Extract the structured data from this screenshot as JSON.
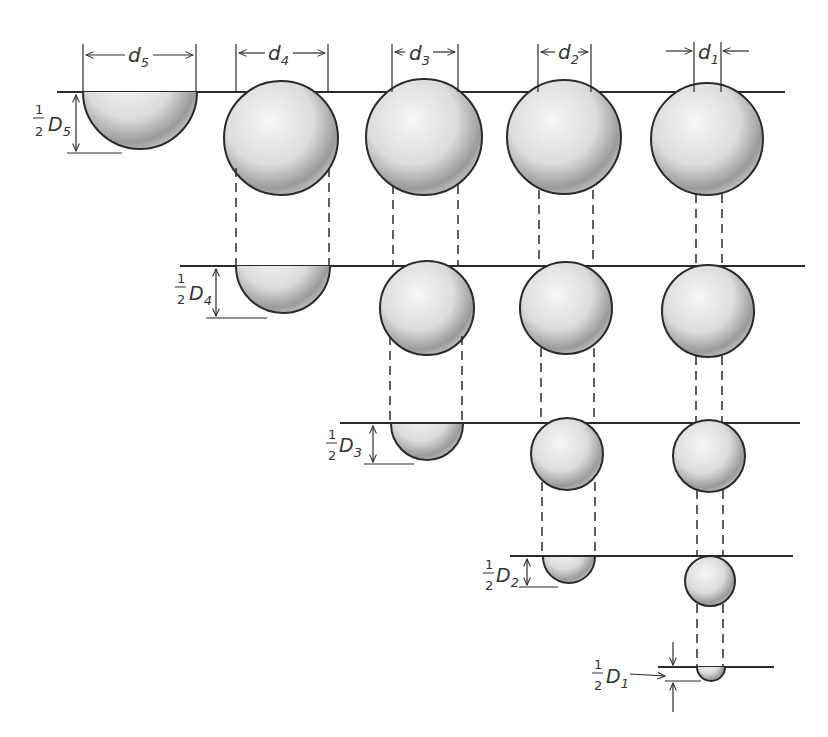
{
  "figure": {
    "colors": {
      "line": "#2a2a2a",
      "shade_light": "#f2f2f2",
      "shade_dark": "#8a8a8a"
    }
  },
  "top_labels": [
    {
      "id": "d5",
      "base": "d",
      "sub": "5"
    },
    {
      "id": "d4",
      "base": "d",
      "sub": "4"
    },
    {
      "id": "d3",
      "base": "d",
      "sub": "3"
    },
    {
      "id": "d2",
      "base": "d",
      "sub": "2"
    },
    {
      "id": "d1",
      "base": "d",
      "sub": "1"
    }
  ],
  "depth_labels": [
    {
      "id": "D5",
      "num": "1",
      "den": "2",
      "base": "D",
      "sub": "5"
    },
    {
      "id": "D4",
      "num": "1",
      "den": "2",
      "base": "D",
      "sub": "4"
    },
    {
      "id": "D3",
      "num": "1",
      "den": "2",
      "base": "D",
      "sub": "3"
    },
    {
      "id": "D2",
      "num": "1",
      "den": "2",
      "base": "D",
      "sub": "2"
    },
    {
      "id": "D1",
      "num": "1",
      "den": "2",
      "base": "D",
      "sub": "1"
    }
  ]
}
